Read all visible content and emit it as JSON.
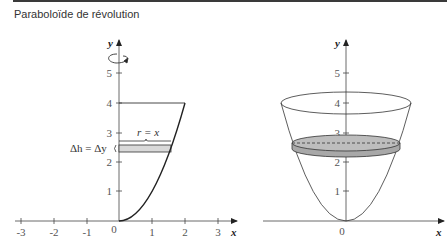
{
  "header": {
    "title": "Paraboloïde de révolution"
  },
  "left_figure": {
    "x_axis_label": "x",
    "y_axis_label": "y",
    "x_ticks": [
      "-3",
      "-2",
      "-1",
      "0",
      "1",
      "2",
      "3"
    ],
    "y_ticks": [
      "1",
      "2",
      "3",
      "4",
      "5"
    ],
    "radius_label": "r = x",
    "height_label": "Δh = Δy",
    "curve": "y = x^2, 0 ≤ x ≤ 2",
    "rotation_icon": "rotation-arrow-icon",
    "strip_color": "#d9d9d9"
  },
  "right_figure": {
    "x_axis_label": "x",
    "y_axis_label": "y",
    "origin_label": "0",
    "y_ticks": [
      "1",
      "2",
      "3",
      "4",
      "5"
    ],
    "disk_color": "#bdbdbd"
  },
  "colors": {
    "line": "#333333",
    "curve": "#222222",
    "disk": "#bdbdbd",
    "strip": "#d9d9d9"
  }
}
